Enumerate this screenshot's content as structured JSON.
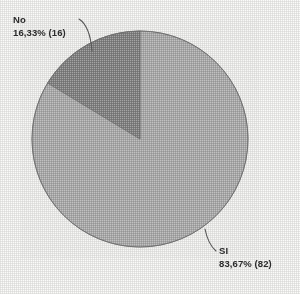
{
  "chart_data": {
    "type": "pie",
    "title": "",
    "categories": [
      "SI",
      "No"
    ],
    "values": [
      82,
      16
    ],
    "percentages": [
      83.67,
      16.33
    ],
    "total": 98,
    "legend": "none",
    "labels_position": "outside-with-leader-lines",
    "slices": [
      {
        "name": "SI",
        "count": 16,
        "percent_text": "83,67%",
        "value_text": "83,67% (82)",
        "count_text": "(82)",
        "value": 82,
        "percent": 83.67,
        "color": "#a6a6a6",
        "start_angle_deg": 0,
        "sweep_deg": 301.2
      },
      {
        "name": "No",
        "value": 16,
        "percent": 16.33,
        "percent_text": "16,33%",
        "count_text": "(16)",
        "value_text": "16,33% (16)",
        "color": "#7d7d7d",
        "start_angle_deg": 301.2,
        "sweep_deg": 58.8
      }
    ]
  },
  "labels": {
    "no": {
      "name": "No",
      "value": "16,33% (16)"
    },
    "si": {
      "name": "SI",
      "value": "83,67% (82)"
    }
  },
  "colors": {
    "slice_si": "#a6a6a6",
    "slice_no": "#7d7d7d",
    "outline": "#6d6d6d",
    "leader_line": "#555555",
    "text": "#2b2b2b",
    "background": "#fbfbf9"
  }
}
